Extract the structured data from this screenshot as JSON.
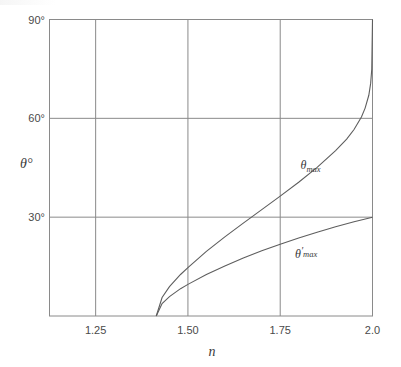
{
  "chart_data": {
    "type": "line",
    "title": "",
    "xlabel": "n",
    "ylabel": "θ°",
    "xlim": [
      1.125,
      2.0
    ],
    "ylim": [
      0,
      90
    ],
    "grid": true,
    "legend_position": "inline-curve-labels",
    "x_ticks": [
      "1.25",
      "1.50",
      "1.75",
      "2.0"
    ],
    "x_tick_values": [
      1.25,
      1.5,
      1.75,
      2.0
    ],
    "y_ticks": [
      "30°",
      "60°",
      "90°"
    ],
    "y_tick_values": [
      30,
      60,
      90
    ],
    "series": [
      {
        "name": "θmax",
        "label": "θ",
        "label_sub": "max",
        "label_prime": "",
        "points": [
          [
            1.4142,
            0.0
          ],
          [
            1.43,
            5.6
          ],
          [
            1.45,
            8.9
          ],
          [
            1.48,
            12.6
          ],
          [
            1.5,
            14.7
          ],
          [
            1.55,
            19.6
          ],
          [
            1.6,
            24.0
          ],
          [
            1.65,
            28.2
          ],
          [
            1.7,
            32.3
          ],
          [
            1.75,
            36.4
          ],
          [
            1.8,
            40.6
          ],
          [
            1.85,
            45.1
          ],
          [
            1.9,
            50.2
          ],
          [
            1.93,
            53.7
          ],
          [
            1.95,
            56.6
          ],
          [
            1.97,
            60.4
          ],
          [
            1.98,
            63.1
          ],
          [
            1.99,
            67.0
          ],
          [
            1.995,
            70.6
          ],
          [
            1.998,
            74.9
          ],
          [
            2.0,
            90.0
          ]
        ]
      },
      {
        "name": "θ'max",
        "label": "θ",
        "label_sub": "max",
        "label_prime": "′",
        "points": [
          [
            1.4142,
            0.0
          ],
          [
            1.43,
            3.8
          ],
          [
            1.45,
            5.9
          ],
          [
            1.48,
            8.3
          ],
          [
            1.5,
            9.6
          ],
          [
            1.55,
            12.6
          ],
          [
            1.6,
            15.2
          ],
          [
            1.65,
            17.6
          ],
          [
            1.7,
            19.8
          ],
          [
            1.75,
            21.8
          ],
          [
            1.8,
            23.7
          ],
          [
            1.85,
            25.4
          ],
          [
            1.9,
            27.1
          ],
          [
            1.95,
            28.6
          ],
          [
            2.0,
            30.0
          ]
        ]
      }
    ],
    "annotations": [
      {
        "text": "θmax",
        "x": 1.805,
        "y": 44.5
      },
      {
        "text": "θ'max",
        "x": 1.79,
        "y": 17.5
      }
    ],
    "colors": {
      "curve": "#5e5e5e",
      "grid": "#8a8a8a",
      "frame": "#8a8a8a",
      "text": "#3a3a3a",
      "background": "#ffffff"
    }
  }
}
